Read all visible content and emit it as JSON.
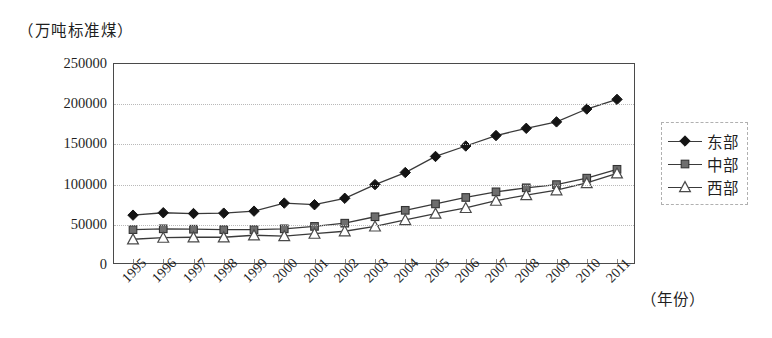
{
  "chart_data": {
    "type": "line",
    "title": "",
    "y_unit_caption": "（万吨标准煤）",
    "xlabel": "（年份）",
    "ylabel": "",
    "grid": true,
    "legend_position": "right",
    "ylim": [
      0,
      250000
    ],
    "yticks": [
      0,
      50000,
      100000,
      150000,
      200000,
      250000
    ],
    "ytick_labels": [
      "0",
      "50000",
      "100000",
      "150000",
      "200000",
      "250000"
    ],
    "categories": [
      "1995",
      "1996",
      "1997",
      "1998",
      "1999",
      "2000",
      "2001",
      "2002",
      "2003",
      "2004",
      "2005",
      "2006",
      "2007",
      "2008",
      "2009",
      "2010",
      "2011"
    ],
    "series": [
      {
        "name": "东部",
        "marker": "filled-diamond",
        "color": "#1b1b1b",
        "values": [
          62000,
          65000,
          64000,
          64500,
          67000,
          77000,
          75000,
          83000,
          100000,
          115000,
          135000,
          148000,
          161000,
          170000,
          178000,
          194000,
          206000
        ]
      },
      {
        "name": "中部",
        "marker": "filled-square",
        "color": "#6f6f6f",
        "values": [
          44000,
          45000,
          44500,
          44000,
          44000,
          45000,
          48000,
          52000,
          60000,
          68000,
          76000,
          84000,
          91000,
          96000,
          100000,
          108000,
          119000
        ]
      },
      {
        "name": "西部",
        "marker": "open-triangle",
        "color": "#ffffff",
        "values": [
          32000,
          34000,
          34500,
          34500,
          37000,
          36000,
          39000,
          42000,
          48000,
          56000,
          64000,
          71000,
          80000,
          87000,
          93000,
          102000,
          114000
        ]
      }
    ]
  },
  "legend": {
    "items": [
      {
        "label": "东部",
        "marker": "filled-diamond"
      },
      {
        "label": "中部",
        "marker": "filled-square"
      },
      {
        "label": "西部",
        "marker": "open-triangle"
      }
    ]
  }
}
